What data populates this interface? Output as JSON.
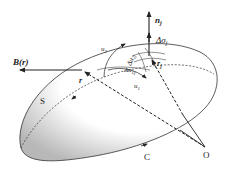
{
  "figure": {
    "type": "surface-integral-diagram",
    "labels": {
      "normal": "n",
      "normal_sub": "j",
      "area_element": "Δσ",
      "area_element_sub": "j",
      "field": "B(r)",
      "position_r": "r",
      "position_rj": "r",
      "position_rj_sub": "j",
      "u1": "u",
      "u1_sub": "1",
      "u2": "u",
      "u2_sub": "2",
      "du1": "Δu",
      "du1_sub": "1j",
      "du2": "Δu",
      "du2_sub": "2j",
      "surface": "S",
      "curve": "C",
      "origin": "O"
    },
    "colors": {
      "line": "#222222",
      "shade_dark": "#bdbdbd",
      "shade_light": "#ffffff"
    }
  }
}
